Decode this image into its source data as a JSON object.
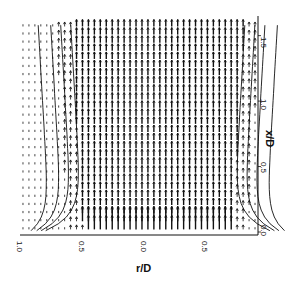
{
  "chart_data": {
    "type": "vector-field",
    "title": "",
    "xlabel": "r/D",
    "ylabel": "x/D",
    "x_axis": {
      "label": "r/D",
      "position": "bottom",
      "ticks": [
        {
          "value": 1.0,
          "label": "1.0"
        },
        {
          "value": 0.5,
          "label": "0.5"
        },
        {
          "value": 0.0,
          "label": "0.0"
        },
        {
          "value": -0.5,
          "label": "0.5"
        }
      ],
      "range": [
        1.1,
        -0.8
      ]
    },
    "y_axis": {
      "label": "x/D",
      "position": "right",
      "ticks": [
        {
          "value": 0.0,
          "label": "0.0"
        },
        {
          "value": 0.5,
          "label": "0.5"
        },
        {
          "value": 1.0,
          "label": "1.0"
        },
        {
          "value": 1.5,
          "label": "1.5"
        }
      ],
      "range": [
        0.0,
        1.65
      ]
    },
    "core_half_width_r_over_D": 0.6,
    "grid": false,
    "legend": null
  },
  "axes": {
    "x_title": "r/D",
    "y_title": "x/D",
    "x_ticks": [
      "1.0",
      "0.5",
      "0.0",
      "0.5"
    ],
    "y_ticks": [
      "0.0",
      "0.5",
      "1.0",
      "1.5"
    ]
  },
  "colors": {
    "ink": "#111111",
    "background": "#ffffff"
  }
}
